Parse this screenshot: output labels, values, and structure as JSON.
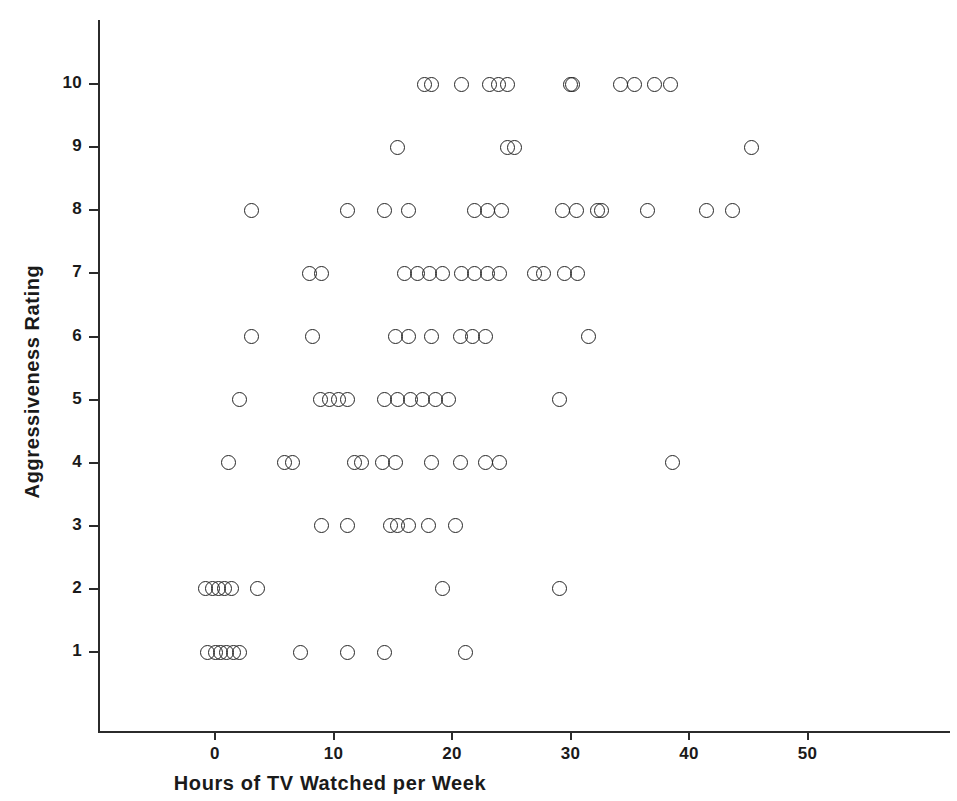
{
  "chart_data": {
    "type": "scatter",
    "title": "",
    "xlabel": "Hours of TV Watched per Week",
    "ylabel": "Aggressiveness Rating",
    "xlim": [
      -1.5,
      62
    ],
    "ylim": [
      0.2,
      11.3
    ],
    "grid": false,
    "legend": null,
    "xticks": [
      0,
      10,
      20,
      30,
      40,
      50
    ],
    "xticklabels": [
      "0",
      "10",
      "20",
      "30",
      "40",
      "50"
    ],
    "yticks": [
      1,
      2,
      3,
      4,
      5,
      6,
      7,
      8,
      9,
      10
    ],
    "yticklabels": [
      "1",
      "2",
      "3",
      "4",
      "5",
      "6",
      "7",
      "8",
      "9",
      "10"
    ],
    "marker": "open-circle",
    "marker_color": "#262626",
    "x": [
      17.7,
      18.3,
      20.8,
      23.2,
      23.9,
      24.7,
      30.0,
      30.2,
      34.2,
      35.4,
      37.1,
      38.4,
      15.4,
      24.7,
      25.3,
      45.3,
      3.1,
      11.2,
      14.3,
      16.3,
      21.9,
      23.0,
      24.2,
      29.3,
      30.5,
      32.3,
      32.6,
      36.5,
      41.5,
      43.7,
      8.0,
      9.0,
      16.0,
      17.1,
      18.1,
      19.2,
      20.8,
      21.9,
      23.0,
      24.0,
      27.0,
      27.7,
      29.5,
      30.6,
      3.1,
      8.2,
      15.2,
      16.3,
      18.3,
      20.7,
      21.7,
      22.8,
      31.5,
      2.1,
      8.9,
      9.7,
      10.4,
      11.2,
      14.3,
      15.4,
      16.5,
      17.5,
      18.6,
      19.7,
      29.1,
      1.1,
      5.9,
      6.5,
      11.8,
      12.4,
      14.1,
      15.2,
      18.3,
      20.7,
      22.8,
      24.0,
      38.6,
      9.0,
      11.2,
      14.8,
      15.4,
      16.3,
      18.0,
      20.3,
      -0.8,
      -0.2,
      0.3,
      0.8,
      1.4,
      3.6,
      19.2,
      29.1,
      -0.6,
      0.0,
      0.5,
      1.0,
      1.6,
      2.1,
      7.2,
      11.2,
      14.3,
      21.1
    ],
    "y": [
      10,
      10,
      10,
      10,
      10,
      10,
      10,
      10,
      10,
      10,
      10,
      10,
      9,
      9,
      9,
      9,
      8,
      8,
      8,
      8,
      8,
      8,
      8,
      8,
      8,
      8,
      8,
      8,
      8,
      8,
      7,
      7,
      7,
      7,
      7,
      7,
      7,
      7,
      7,
      7,
      7,
      7,
      7,
      7,
      6,
      6,
      6,
      6,
      6,
      6,
      6,
      6,
      6,
      5,
      5,
      5,
      5,
      5,
      5,
      5,
      5,
      5,
      5,
      5,
      5,
      4,
      4,
      4,
      4,
      4,
      4,
      4,
      4,
      4,
      4,
      4,
      4,
      3,
      3,
      3,
      3,
      3,
      3,
      3,
      2,
      2,
      2,
      2,
      2,
      2,
      2,
      2,
      1,
      1,
      1,
      1,
      1,
      1,
      1,
      1,
      1,
      1
    ],
    "n_points": 100,
    "counts_by_rating": {
      "1": 10,
      "2": 8,
      "3": 7,
      "4": 12,
      "5": 12,
      "6": 9,
      "7": 14,
      "8": 14,
      "9": 4,
      "10": 12
    }
  },
  "axes": {
    "x_axis_name": "x-axis",
    "y_axis_name": "y-axis"
  }
}
